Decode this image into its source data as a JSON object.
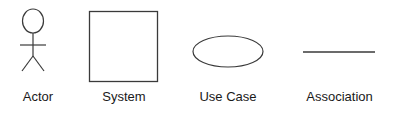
{
  "diagram": {
    "background_color": "#ffffff",
    "stroke_color": "#3a3a3a",
    "text_color": "#1a1a1a",
    "width": 401,
    "height": 117,
    "items": [
      {
        "key": "actor",
        "label": "Actor",
        "shape": "stick-figure",
        "notation": "UML actor"
      },
      {
        "key": "system",
        "label": "System",
        "shape": "rectangle",
        "notation": "UML system boundary"
      },
      {
        "key": "usecase",
        "label": "Use Case",
        "shape": "ellipse",
        "notation": "UML use case"
      },
      {
        "key": "association",
        "label": "Association",
        "shape": "line",
        "notation": "UML association"
      }
    ]
  }
}
